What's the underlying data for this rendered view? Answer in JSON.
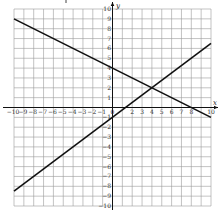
{
  "chart_data": {
    "type": "line",
    "title": "",
    "xlabel": "x",
    "ylabel": "y",
    "xlim": [
      -10,
      10
    ],
    "ylim": [
      -10,
      10
    ],
    "grid": true,
    "x_ticks": [
      -10,
      -9,
      -8,
      -7,
      -6,
      -5,
      -4,
      -3,
      -2,
      -1,
      0,
      2,
      3,
      4,
      5,
      6,
      7,
      8,
      10
    ],
    "y_ticks": [
      10,
      9,
      8,
      7,
      6,
      5,
      4,
      3,
      2,
      1,
      -1,
      -2,
      -3,
      -4,
      -5,
      -6,
      -7,
      -8,
      -9,
      -10
    ],
    "series": [
      {
        "name": "line-decreasing",
        "equation": "y = -0.5x + 4",
        "slope": -0.5,
        "intercept": 4,
        "x": [
          -10,
          10
        ],
        "y": [
          9,
          -1
        ]
      },
      {
        "name": "line-increasing",
        "equation": "y = 0.75x - 1",
        "slope": 0.75,
        "intercept": -1,
        "x": [
          -10,
          10
        ],
        "y": [
          -8.5,
          6.5
        ]
      }
    ],
    "annotations": [
      {
        "type": "intersection",
        "x": 4,
        "y": 2
      }
    ]
  },
  "style": {
    "line_color": "#111111",
    "grid_color": "#9a9a9a",
    "axis_color": "#111111"
  }
}
